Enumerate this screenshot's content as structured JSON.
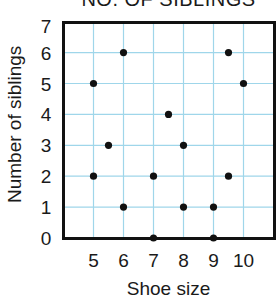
{
  "chart_data": {
    "type": "scatter",
    "title": "NO. OF SIBLINGS",
    "xlabel": "Shoe size",
    "ylabel": "Number of siblings",
    "xlim": [
      4,
      11
    ],
    "ylim": [
      0,
      7
    ],
    "x_ticks": [
      5,
      6,
      7,
      8,
      9,
      10
    ],
    "y_ticks": [
      0,
      1,
      2,
      3,
      4,
      5,
      6,
      7
    ],
    "grid": true,
    "legend": null,
    "points": [
      {
        "x": 6,
        "y": 6
      },
      {
        "x": 9.5,
        "y": 6
      },
      {
        "x": 5,
        "y": 5
      },
      {
        "x": 10,
        "y": 5
      },
      {
        "x": 7.5,
        "y": 4
      },
      {
        "x": 5.5,
        "y": 3
      },
      {
        "x": 8,
        "y": 3
      },
      {
        "x": 5,
        "y": 2
      },
      {
        "x": 7,
        "y": 2
      },
      {
        "x": 9.5,
        "y": 2
      },
      {
        "x": 6,
        "y": 1
      },
      {
        "x": 8,
        "y": 1
      },
      {
        "x": 9,
        "y": 1
      },
      {
        "x": 7,
        "y": 0
      },
      {
        "x": 9,
        "y": 0
      }
    ],
    "colors": {
      "grid": "#9fd6ea",
      "frame": "#111111",
      "point": "#111111"
    }
  }
}
